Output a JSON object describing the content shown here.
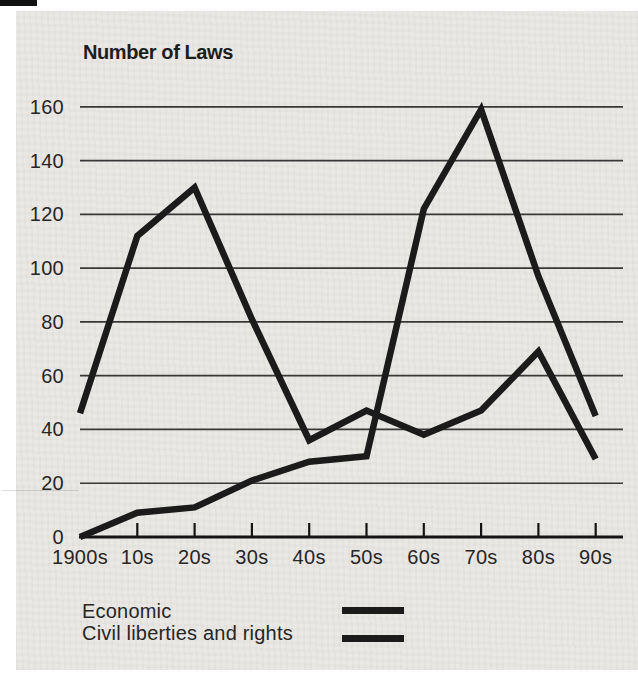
{
  "page": {
    "background_color": "#eae8e4",
    "margin_color": "#ffffff",
    "scan_mark_color": "#111111",
    "text_color": "#262626"
  },
  "chart_data": {
    "type": "line",
    "title": "Number of Laws",
    "xlabel": "",
    "ylabel": "",
    "categories": [
      "1900s",
      "10s",
      "20s",
      "30s",
      "40s",
      "50s",
      "60s",
      "70s",
      "80s",
      "90s"
    ],
    "series": [
      {
        "name": "Economic",
        "color": "#1b1b1b",
        "values": [
          46,
          112,
          130,
          81,
          36,
          47,
          38,
          47,
          69,
          29
        ]
      },
      {
        "name": "Civil liberties and rights",
        "color": "#1b1b1b",
        "values": [
          0,
          9,
          11,
          21,
          28,
          30,
          122,
          159,
          97,
          45
        ]
      }
    ],
    "ylim": [
      0,
      160
    ],
    "yticks": [
      0,
      20,
      40,
      60,
      80,
      100,
      120,
      140,
      160
    ],
    "grid": "horizontal",
    "gridline_color": "#383838",
    "axis_color": "#141414",
    "legend_position": "bottom-left"
  }
}
